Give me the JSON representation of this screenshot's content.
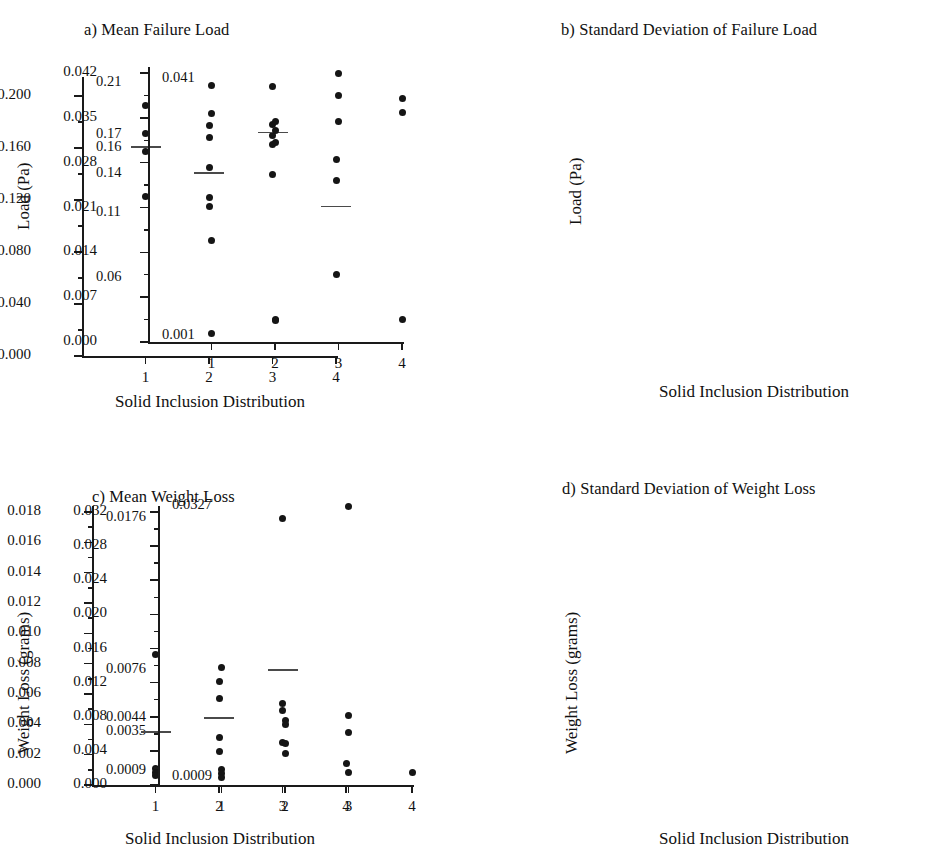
{
  "figure": {
    "xlabel": "Solid Inclusion Distribution",
    "categories": [
      "1",
      "2",
      "3",
      "4"
    ]
  },
  "chart_data": [
    {
      "type": "scatter",
      "panel": "a",
      "title": "a) Mean Failure Load",
      "xlabel": "Solid Inclusion Distribution",
      "ylabel": "Load (Pa)",
      "ylim": [
        0.0,
        0.21
      ],
      "ytick_labels": [
        "0.000",
        "0.040",
        "0.080",
        "0.120",
        "0.160",
        "0.200"
      ],
      "ytick_values": [
        0.0,
        0.04,
        0.08,
        0.12,
        0.16,
        0.2
      ],
      "minor_ticks": true,
      "grid": false,
      "legend": "none",
      "categories": [
        "1",
        "2",
        "3",
        "4"
      ],
      "annotations": [
        {
          "label": "0.21",
          "value": 0.21
        },
        {
          "label": "0.17",
          "value": 0.17
        },
        {
          "label": "0.16",
          "value": 0.16
        },
        {
          "label": "0.14",
          "value": 0.14
        },
        {
          "label": "0.11",
          "value": 0.11
        },
        {
          "label": "0.06",
          "value": 0.06
        }
      ],
      "groups": [
        {
          "category": "1",
          "values": [
            0.193,
            0.171,
            0.157,
            0.123
          ],
          "mean": 0.161
        },
        {
          "category": "2",
          "values": [
            0.177,
            0.168,
            0.145,
            0.122,
            0.115
          ],
          "mean": 0.141
        },
        {
          "category": "3",
          "values": [
            0.207,
            0.178,
            0.17,
            0.163,
            0.14
          ],
          "mean": 0.172
        },
        {
          "category": "4",
          "values": [
            0.151,
            0.135,
            0.063
          ],
          "mean": 0.115
        }
      ]
    },
    {
      "type": "scatter",
      "panel": "b",
      "title": "b) Standard Deviation of Failure Load",
      "xlabel": "Solid Inclusion Distribution",
      "ylabel": "Load (Pa)",
      "ylim": [
        0.0,
        0.042
      ],
      "ytick_labels": [
        "0.000",
        "0.007",
        "0.014",
        "0.021",
        "0.028",
        "0.035",
        "0.042"
      ],
      "ytick_values": [
        0.0,
        0.007,
        0.014,
        0.021,
        0.028,
        0.035,
        0.042
      ],
      "minor_ticks": true,
      "grid": false,
      "legend": "none",
      "categories": [
        "1",
        "2",
        "3",
        "4"
      ],
      "annotations": [
        {
          "label": "0.041",
          "value": 0.041
        },
        {
          "label": "0.001",
          "value": 0.001
        }
      ],
      "groups": [
        {
          "category": "1",
          "values": [
            0.04,
            0.0357,
            0.0158,
            0.0014
          ],
          "mean": null
        },
        {
          "category": "2",
          "values": [
            0.0345,
            0.033,
            0.0312,
            0.0035,
            0.0033
          ],
          "mean": null
        },
        {
          "category": "3",
          "values": [
            0.042,
            0.0385,
            0.0345
          ],
          "mean": null
        },
        {
          "category": "4",
          "values": [
            0.038,
            0.0358,
            0.0035
          ],
          "mean": null
        }
      ]
    },
    {
      "type": "scatter",
      "panel": "c",
      "title": "c) Mean Weight Loss",
      "xlabel": "Solid Inclusion Distribution",
      "ylabel": "Weight Loss (grams)",
      "ylim": [
        0.0,
        0.018
      ],
      "ytick_labels": [
        "0.000",
        "0.002",
        "0.004",
        "0.006",
        "0.008",
        "0.010",
        "0.012",
        "0.014",
        "0.016",
        "0.018"
      ],
      "ytick_values": [
        0.0,
        0.002,
        0.004,
        0.006,
        0.008,
        0.01,
        0.012,
        0.014,
        0.016,
        0.018
      ],
      "minor_ticks": true,
      "grid": false,
      "legend": "none",
      "categories": [
        "1",
        "2",
        "3",
        "4"
      ],
      "annotations": [
        {
          "label": "0.0176",
          "value": 0.0176
        },
        {
          "label": "0.0076",
          "value": 0.0076
        },
        {
          "label": "0.0044",
          "value": 0.0044
        },
        {
          "label": "0.0035",
          "value": 0.0035
        },
        {
          "label": "0.0009",
          "value": 0.0009
        }
      ],
      "groups": [
        {
          "category": "1",
          "values": [
            0.0086,
            0.0011,
            0.0008,
            0.0006
          ],
          "mean": 0.0035
        },
        {
          "category": "2",
          "values": [
            0.0068,
            0.0057,
            0.0031,
            0.0022
          ],
          "mean": 0.0044
        },
        {
          "category": "3",
          "values": [
            0.0176,
            0.0054,
            0.0049,
            0.0028
          ],
          "mean": 0.0076
        },
        {
          "category": "4",
          "values": [
            0.0014
          ],
          "mean": null
        }
      ]
    },
    {
      "type": "scatter",
      "panel": "d",
      "title": "d) Standard Deviation of Weight Loss",
      "xlabel": "Solid Inclusion Distribution",
      "ylabel": "Weight Loss (grams)",
      "ylim": [
        0.0,
        0.032
      ],
      "ytick_labels": [
        "0.000",
        "0.004",
        "0.008",
        "0.012",
        "0.016",
        "0.020",
        "0.024",
        "0.028",
        "0.032"
      ],
      "ytick_values": [
        0.0,
        0.004,
        0.008,
        0.012,
        0.016,
        0.02,
        0.024,
        0.028,
        0.032
      ],
      "minor_ticks": true,
      "grid": false,
      "legend": "none",
      "categories": [
        "1",
        "2",
        "3",
        "4"
      ],
      "annotations": [
        {
          "label": "0.0327",
          "value": 0.0327
        },
        {
          "label": "0.0009",
          "value": 0.0009
        }
      ],
      "groups": [
        {
          "category": "1",
          "values": [
            0.0138,
            0.0018,
            0.0013,
            0.0009
          ],
          "mean": null
        },
        {
          "category": "2",
          "values": [
            0.0076,
            0.0071,
            0.0049,
            0.0037
          ],
          "mean": null
        },
        {
          "category": "3",
          "values": [
            0.0327,
            0.0081,
            0.0061,
            0.0015
          ],
          "mean": null
        },
        {
          "category": "4",
          "values": [
            0.0015
          ],
          "mean": null
        }
      ]
    }
  ]
}
